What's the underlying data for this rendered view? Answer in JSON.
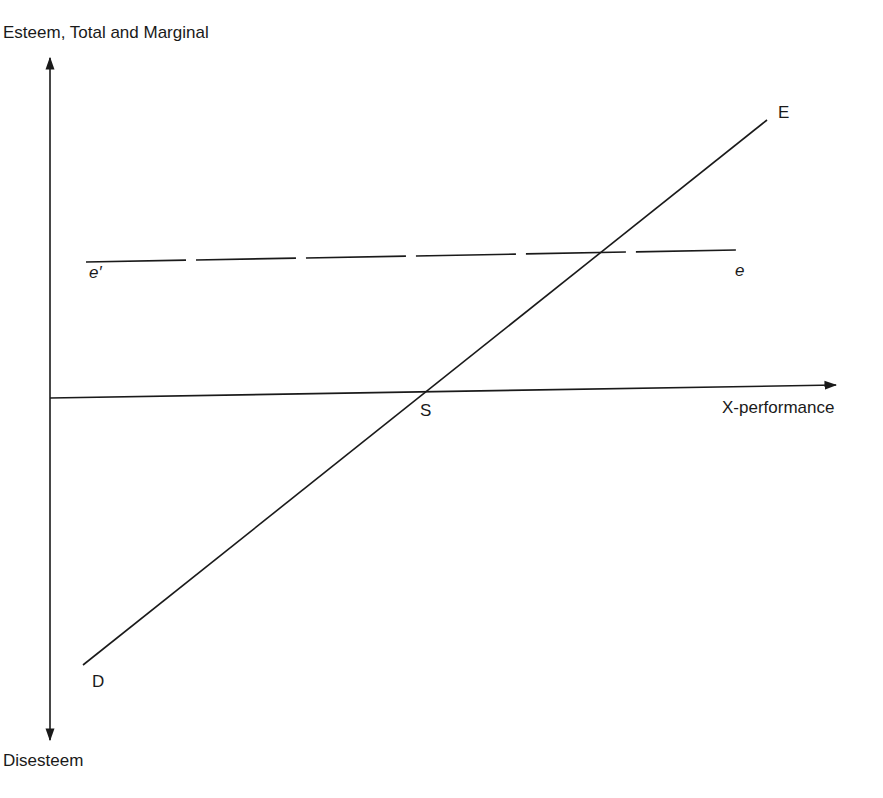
{
  "diagram": {
    "colors": {
      "ink": "#1a1a1a",
      "background": "#ffffff"
    },
    "axes": {
      "y_label_top": "Esteem, Total and Marginal",
      "y_label_bottom": "Disesteem",
      "x_label": "X-performance"
    },
    "lines": {
      "total_esteem": {
        "start_label": "D",
        "end_label": "E",
        "style": "solid"
      },
      "marginal_esteem": {
        "start_label": "e′",
        "end_label": "e",
        "style": "dashed"
      }
    },
    "points": {
      "zero_crossing": "S"
    }
  }
}
